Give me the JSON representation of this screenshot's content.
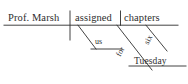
{
  "diagram": {
    "type": "reed-kellogg-sentence-diagram",
    "sentence": "Prof. Marsh assigned us six chapters for Tuesday",
    "ink_color": "#2e2e2e",
    "background_color": "#ffffff",
    "labels": {
      "subject": "Prof. Marsh",
      "verb": "assigned",
      "direct_object": "chapters",
      "indirect_object": "us",
      "preposition": "for",
      "object_modifier": "six",
      "prepositional_object": "Tuesday"
    },
    "lines": {
      "baseline": {
        "x1": 4,
        "y1": 25,
        "x2": 178,
        "y2": 25
      },
      "subject_verb_divider": {
        "x1": 70,
        "y1": 11,
        "x2": 70,
        "y2": 40
      },
      "verb_object_divider": {
        "x1": 120,
        "y1": 11,
        "x2": 120,
        "y2": 25
      },
      "indirect_object_slant": {
        "x1": 78,
        "y1": 25,
        "x2": 96,
        "y2": 48
      },
      "indirect_object_shelf": {
        "x1": 96,
        "y1": 48,
        "x2": 124,
        "y2": 48
      },
      "preposition_slant": {
        "x1": 118,
        "y1": 25,
        "x2": 152,
        "y2": 68
      },
      "preposition_shelf": {
        "x1": 130,
        "y1": 67,
        "x2": 185,
        "y2": 67
      },
      "modifier_slant": {
        "x1": 146,
        "y1": 25,
        "x2": 166,
        "y2": 50
      }
    }
  }
}
